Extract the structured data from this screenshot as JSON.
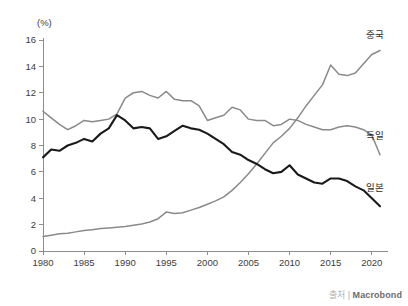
{
  "chart_data": {
    "type": "line",
    "title": "",
    "xlabel": "",
    "ylabel": "",
    "unit_label": "(%)",
    "xlim": [
      1980,
      2021
    ],
    "ylim": [
      0,
      16
    ],
    "grid": false,
    "legend_position": "right-inline",
    "x_ticks": [
      1980,
      1985,
      1990,
      1995,
      2000,
      2005,
      2010,
      2015,
      2020
    ],
    "y_ticks": [
      0,
      2,
      4,
      6,
      8,
      10,
      12,
      14,
      16
    ],
    "x": [
      1980,
      1981,
      1982,
      1983,
      1984,
      1985,
      1986,
      1987,
      1988,
      1989,
      1990,
      1991,
      1992,
      1993,
      1994,
      1995,
      1996,
      1997,
      1998,
      1999,
      2000,
      2001,
      2002,
      2003,
      2004,
      2005,
      2006,
      2007,
      2008,
      2009,
      2010,
      2011,
      2012,
      2013,
      2014,
      2015,
      2016,
      2017,
      2018,
      2019,
      2020,
      2021
    ],
    "series": [
      {
        "name": "중국",
        "color": "#8a8a8a",
        "width": 1.5,
        "values": [
          1.1,
          1.2,
          1.3,
          1.35,
          1.45,
          1.55,
          1.62,
          1.7,
          1.75,
          1.8,
          1.85,
          1.95,
          2.05,
          2.2,
          2.45,
          2.95,
          2.85,
          2.9,
          3.1,
          3.3,
          3.55,
          3.8,
          4.1,
          4.6,
          5.2,
          5.85,
          6.6,
          7.4,
          8.2,
          8.7,
          9.3,
          10.1,
          11.0,
          11.8,
          12.6,
          14.1,
          13.4,
          13.3,
          13.5,
          14.2,
          14.9,
          15.2
        ]
      },
      {
        "name": "독일",
        "color": "#8a8a8a",
        "width": 1.5,
        "values": [
          10.6,
          10.1,
          9.6,
          9.2,
          9.5,
          9.9,
          9.8,
          9.9,
          10.0,
          10.4,
          11.6,
          12.0,
          12.1,
          11.8,
          11.6,
          12.1,
          11.5,
          11.4,
          11.4,
          11.0,
          9.9,
          10.1,
          10.3,
          10.9,
          10.7,
          10.0,
          9.9,
          9.9,
          9.5,
          9.6,
          10.0,
          9.9,
          9.6,
          9.4,
          9.2,
          9.2,
          9.4,
          9.5,
          9.4,
          9.2,
          8.8,
          7.3
        ]
      },
      {
        "name": "일본",
        "color": "#1a1a1a",
        "width": 2.1,
        "values": [
          7.1,
          7.7,
          7.6,
          8.0,
          8.2,
          8.5,
          8.3,
          8.9,
          9.3,
          10.3,
          9.9,
          9.3,
          9.4,
          9.3,
          8.5,
          8.7,
          9.1,
          9.5,
          9.3,
          9.2,
          8.9,
          8.5,
          8.1,
          7.5,
          7.3,
          6.9,
          6.6,
          6.2,
          5.9,
          6.0,
          6.5,
          5.8,
          5.5,
          5.2,
          5.1,
          5.5,
          5.5,
          5.3,
          4.9,
          4.6,
          4.0,
          3.4
        ]
      }
    ],
    "series_label_positions": [
      {
        "name": "중국",
        "x": 366,
        "y": 38
      },
      {
        "name": "독일",
        "x": 366,
        "y": 139
      },
      {
        "name": "일본",
        "x": 366,
        "y": 191
      }
    ]
  },
  "source": {
    "label": "출처",
    "separator": "|",
    "name": "Macrobond"
  }
}
